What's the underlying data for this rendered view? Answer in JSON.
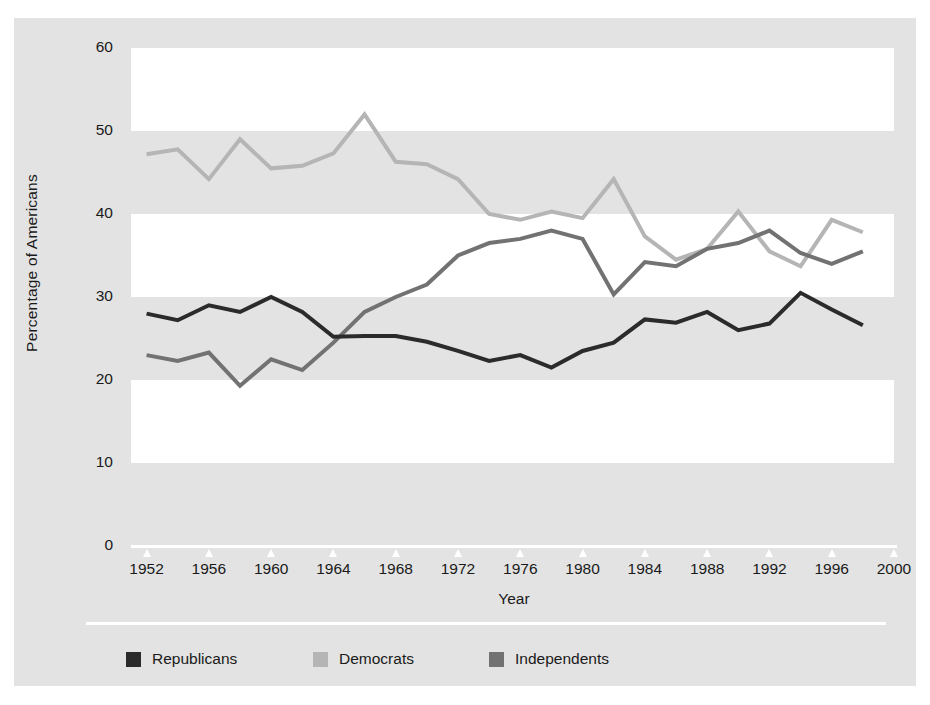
{
  "figure": {
    "bleed_text": "",
    "background_color": "#e3e3e3",
    "band_color": "#ffffff"
  },
  "axis": {
    "y_title": "Percentage of Americans",
    "x_title": "Year",
    "y_ticks": [
      60,
      50,
      40,
      30,
      20,
      10,
      0
    ],
    "x_ticks": [
      1952,
      1956,
      1960,
      1964,
      1968,
      1972,
      1976,
      1980,
      1984,
      1988,
      1992,
      1996,
      2000
    ]
  },
  "legend": {
    "items": [
      {
        "label": "Republicans",
        "color": "#2b2b2b",
        "left": 40
      },
      {
        "label": "Democrats",
        "color": "#b5b5b5",
        "left": 227
      },
      {
        "label": "Independents",
        "color": "#727272",
        "left": 403
      }
    ]
  },
  "chart_data": {
    "type": "line",
    "title": "",
    "subtitle": "",
    "xlabel": "Year",
    "ylabel": "Percentage of Americans",
    "xlim": [
      1951,
      2000
    ],
    "ylim": [
      0,
      60
    ],
    "yticks": [
      0,
      10,
      20,
      30,
      40,
      50,
      60
    ],
    "xticks": [
      1952,
      1956,
      1960,
      1964,
      1968,
      1972,
      1976,
      1980,
      1984,
      1988,
      1992,
      1996,
      2000
    ],
    "grid": "alternating horizontal bands (white 60-50, 40-30, 20-10)",
    "legend_position": "bottom-left",
    "x": [
      1952,
      1954,
      1956,
      1958,
      1960,
      1962,
      1964,
      1966,
      1968,
      1970,
      1972,
      1974,
      1976,
      1978,
      1980,
      1982,
      1984,
      1986,
      1988,
      1990,
      1992,
      1994,
      1996,
      1998
    ],
    "series": [
      {
        "name": "Republicans",
        "color": "#2b2b2b",
        "values": [
          28.0,
          27.2,
          29.0,
          28.2,
          30.0,
          28.2,
          25.2,
          25.3,
          25.3,
          24.6,
          23.5,
          22.3,
          23.0,
          21.5,
          23.5,
          24.5,
          27.3,
          26.9,
          28.2,
          26.0,
          26.8,
          30.5,
          28.5,
          26.6
        ]
      },
      {
        "name": "Democrats",
        "color": "#b5b5b5",
        "values": [
          47.2,
          47.8,
          44.2,
          49.0,
          45.5,
          45.8,
          47.3,
          52.0,
          46.3,
          46.0,
          44.2,
          40.0,
          39.3,
          40.3,
          39.5,
          44.2,
          37.3,
          34.5,
          35.8,
          40.3,
          35.5,
          33.7,
          39.3,
          37.8
        ]
      },
      {
        "name": "Independents",
        "color": "#727272",
        "values": [
          23.0,
          22.3,
          23.3,
          19.3,
          22.5,
          21.2,
          24.5,
          28.2,
          30.0,
          31.5,
          35.0,
          36.5,
          37.0,
          38.0,
          37.0,
          30.3,
          34.2,
          33.7,
          35.8,
          36.5,
          38.0,
          35.3,
          34.0,
          35.5
        ]
      }
    ]
  }
}
